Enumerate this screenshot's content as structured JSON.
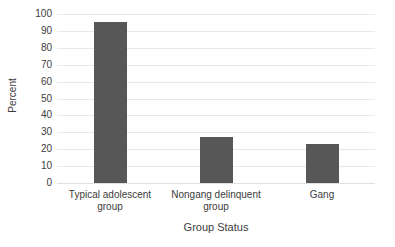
{
  "chart_data": {
    "type": "bar",
    "title": "",
    "xlabel": "Group Status",
    "ylabel": "Percent",
    "categories": [
      "Typical adolescent group",
      "Nongang delinquent group",
      "Gang"
    ],
    "values": [
      95,
      27,
      23
    ],
    "ylim": [
      0,
      100
    ],
    "ytick_step": 10,
    "yticks": [
      100,
      90,
      80,
      70,
      60,
      50,
      40,
      30,
      20,
      10,
      0
    ],
    "ytick_labels": [
      "100",
      "90",
      "80",
      "70",
      "60",
      "50",
      "40",
      "30",
      "20",
      "10",
      "0"
    ],
    "grid": "horizontal",
    "legend": "none",
    "bar_color": "#575757",
    "gridline_color": "#e8e8e8",
    "background_color": "#ffffff",
    "text_color": "#3c3c3c"
  }
}
